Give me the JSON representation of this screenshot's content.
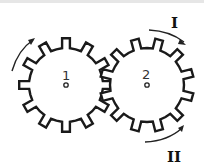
{
  "diagram": {
    "gears": [
      {
        "id": "gear-1",
        "label": "1",
        "teeth": 12
      },
      {
        "id": "gear-2",
        "label": "2",
        "teeth": 12
      }
    ],
    "rotation_labels": {
      "upper": "I",
      "lower": "II"
    },
    "colors": {
      "stroke": "#1a1a1a",
      "background": "#ffffff"
    }
  }
}
